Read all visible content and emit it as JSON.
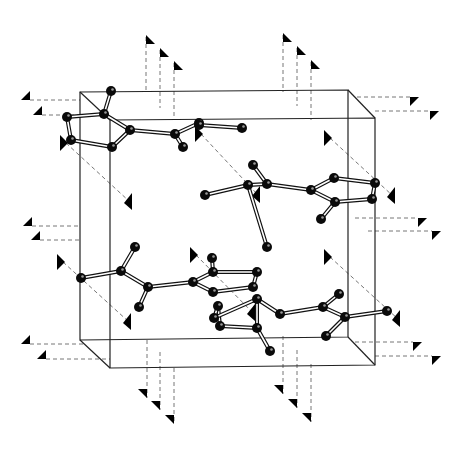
{
  "figure": {
    "title": "",
    "colors": {
      "atom": "#0a0a0a",
      "bond": "#111111",
      "cell_edge": "#222222",
      "symmetry_axis": "#666666",
      "background": "#ffffff"
    }
  },
  "cell": {
    "front": [
      [
        80,
        92
      ],
      [
        348,
        90
      ],
      [
        348,
        337
      ],
      [
        80,
        340
      ]
    ],
    "back": [
      [
        110,
        120
      ],
      [
        375,
        118
      ],
      [
        375,
        365
      ],
      [
        110,
        368
      ]
    ]
  },
  "molecules": [
    {
      "name": "molecule-1",
      "atoms": [
        [
          111,
          91
        ],
        [
          104,
          114
        ],
        [
          67,
          117
        ],
        [
          71,
          140
        ],
        [
          112,
          147
        ],
        [
          130,
          130
        ],
        [
          175,
          134
        ],
        [
          183,
          147
        ],
        [
          199,
          123
        ],
        [
          199,
          125
        ],
        [
          242,
          128
        ]
      ],
      "bonds": [
        [
          0,
          1
        ],
        [
          1,
          2
        ],
        [
          2,
          3
        ],
        [
          3,
          4
        ],
        [
          4,
          5
        ],
        [
          5,
          1
        ],
        [
          5,
          6
        ],
        [
          6,
          7
        ],
        [
          6,
          8
        ],
        [
          8,
          9
        ],
        [
          9,
          10
        ]
      ]
    },
    {
      "name": "molecule-2",
      "atoms": [
        [
          205,
          195
        ],
        [
          248,
          185
        ],
        [
          267,
          184
        ],
        [
          253,
          165
        ],
        [
          267,
          247
        ],
        [
          311,
          190
        ],
        [
          334,
          178
        ],
        [
          375,
          183
        ],
        [
          372,
          199
        ],
        [
          335,
          202
        ],
        [
          321,
          219
        ]
      ],
      "bonds": [
        [
          0,
          1
        ],
        [
          1,
          2
        ],
        [
          2,
          3
        ],
        [
          1,
          4
        ],
        [
          2,
          5
        ],
        [
          5,
          6
        ],
        [
          6,
          7
        ],
        [
          7,
          8
        ],
        [
          8,
          9
        ],
        [
          9,
          5
        ],
        [
          9,
          10
        ]
      ]
    },
    {
      "name": "molecule-3",
      "atoms": [
        [
          81,
          278
        ],
        [
          121,
          271
        ],
        [
          135,
          247
        ],
        [
          148,
          287
        ],
        [
          139,
          307
        ],
        [
          193,
          282
        ],
        [
          213,
          272
        ],
        [
          212,
          258
        ],
        [
          257,
          272
        ],
        [
          253,
          287
        ],
        [
          213,
          292
        ]
      ],
      "bonds": [
        [
          0,
          1
        ],
        [
          1,
          2
        ],
        [
          1,
          3
        ],
        [
          3,
          4
        ],
        [
          3,
          5
        ],
        [
          5,
          6
        ],
        [
          6,
          7
        ],
        [
          6,
          8
        ],
        [
          8,
          9
        ],
        [
          9,
          10
        ],
        [
          10,
          5
        ]
      ]
    },
    {
      "name": "molecule-4",
      "atoms": [
        [
          218,
          306
        ],
        [
          220,
          326
        ],
        [
          257,
          328
        ],
        [
          257,
          299
        ],
        [
          214,
          318
        ],
        [
          270,
          351
        ],
        [
          280,
          314
        ],
        [
          323,
          307
        ],
        [
          339,
          294
        ],
        [
          345,
          317
        ],
        [
          326,
          336
        ],
        [
          387,
          311
        ]
      ],
      "bonds": [
        [
          0,
          1
        ],
        [
          1,
          2
        ],
        [
          2,
          3
        ],
        [
          3,
          4
        ],
        [
          4,
          0
        ],
        [
          2,
          5
        ],
        [
          3,
          6
        ],
        [
          6,
          7
        ],
        [
          7,
          8
        ],
        [
          7,
          9
        ],
        [
          9,
          10
        ],
        [
          9,
          11
        ]
      ]
    }
  ],
  "symmetry_axes": {
    "vertical_top": [
      [
        146,
        37,
        146,
        92,
        "down-right"
      ],
      [
        160,
        50,
        160,
        108,
        "down-right"
      ],
      [
        174,
        63,
        174,
        120,
        "down-right"
      ],
      [
        283,
        35,
        283,
        92,
        "down-right"
      ],
      [
        297,
        48,
        297,
        106,
        "down-right"
      ],
      [
        311,
        62,
        311,
        120,
        "down-right"
      ]
    ],
    "vertical_bottom": [
      [
        147,
        340,
        147,
        398,
        "down-left"
      ],
      [
        160,
        352,
        160,
        410,
        "down-left"
      ],
      [
        174,
        368,
        174,
        424,
        "down-left"
      ],
      [
        283,
        336,
        283,
        394,
        "down-left"
      ],
      [
        297,
        350,
        297,
        408,
        "down-left"
      ],
      [
        311,
        364,
        311,
        422,
        "down-left"
      ]
    ],
    "horizontal_left": [
      [
        30,
        100,
        80,
        100,
        "left-up"
      ],
      [
        42,
        115,
        110,
        115,
        "left-up"
      ],
      [
        32,
        226,
        80,
        226,
        "left-up"
      ],
      [
        40,
        240,
        80,
        240,
        "left-up"
      ],
      [
        30,
        344,
        85,
        344,
        "left-up"
      ],
      [
        46,
        359,
        110,
        359,
        "left-up"
      ]
    ],
    "horizontal_right": [
      [
        357,
        97,
        410,
        97,
        "right-down"
      ],
      [
        375,
        111,
        430,
        111,
        "right-down"
      ],
      [
        355,
        218,
        418,
        218,
        "right-down"
      ],
      [
        368,
        231,
        432,
        231,
        "right-down"
      ],
      [
        355,
        342,
        413,
        342,
        "right-down"
      ],
      [
        375,
        356,
        432,
        356,
        "right-down"
      ]
    ],
    "diagonal": [
      [
        66,
        143,
        130,
        202
      ],
      [
        201,
        134,
        258,
        195
      ],
      [
        330,
        138,
        393,
        196
      ],
      [
        63,
        262,
        129,
        322
      ],
      [
        196,
        255,
        253,
        313
      ],
      [
        330,
        257,
        398,
        319
      ]
    ]
  }
}
